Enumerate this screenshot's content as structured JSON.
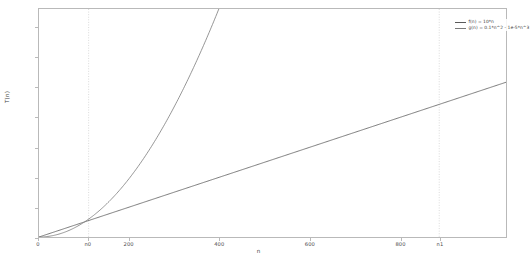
{
  "chart_data": {
    "type": "line",
    "title": "",
    "xlabel": "n",
    "ylabel": "T(n)",
    "xlim": [
      0,
      1035
    ],
    "ylim": [
      0,
      15250
    ],
    "grid": false,
    "legend_position": "upper right",
    "xticks": [
      {
        "value": 0,
        "label": "0"
      },
      {
        "value": 110,
        "label": "n0"
      },
      {
        "value": 200,
        "label": "200"
      },
      {
        "value": 400,
        "label": "400"
      },
      {
        "value": 600,
        "label": "600"
      },
      {
        "value": 800,
        "label": "800"
      },
      {
        "value": 887,
        "label": "n1"
      }
    ],
    "yticks": [
      {
        "value": 0,
        "label": "0"
      },
      {
        "value": 2000,
        "label": "2000"
      },
      {
        "value": 4000,
        "label": "4000"
      },
      {
        "value": 6000,
        "label": "6000"
      },
      {
        "value": 8000,
        "label": "8000"
      },
      {
        "value": 10000,
        "label": "10000"
      },
      {
        "value": 12000,
        "label": "12000"
      },
      {
        "value": 14000,
        "label": "14000"
      }
    ],
    "series": [
      {
        "name": "f(n) = 10*n",
        "legend_label": "f(n) = 10*n",
        "color": "#5a5a5a",
        "kind": "linear",
        "coefficients": {
          "a1": 10
        },
        "x": [
          0,
          100,
          200,
          300,
          400,
          500,
          600,
          700,
          800,
          900,
          1000
        ],
        "values": [
          0,
          1000,
          2000,
          3000,
          4000,
          5000,
          6000,
          7000,
          8000,
          9000,
          10000
        ]
      },
      {
        "name": "g(n) = 0.1*n^2 - 1e-5*n^3",
        "legend_label": "g(n) = 0.1*n^2 - 1e-5*n^3",
        "color": "#7a7a7a",
        "kind": "cubic",
        "coefficients": {
          "a2": 0.1,
          "a3": -1e-05
        },
        "x": [
          0,
          100,
          200,
          300,
          400,
          500,
          600,
          667,
          700,
          800,
          900,
          1000
        ],
        "values": [
          0,
          990,
          3920,
          8730,
          15360,
          23750,
          33840,
          40140,
          45570,
          58880,
          73710,
          90000
        ]
      }
    ],
    "markers": [
      {
        "name": "n0",
        "x": 110,
        "label": "n0",
        "style": "dotted-vline"
      },
      {
        "name": "n1",
        "x": 887,
        "label": "n1",
        "style": "dotted-vline"
      }
    ],
    "annotations": []
  }
}
